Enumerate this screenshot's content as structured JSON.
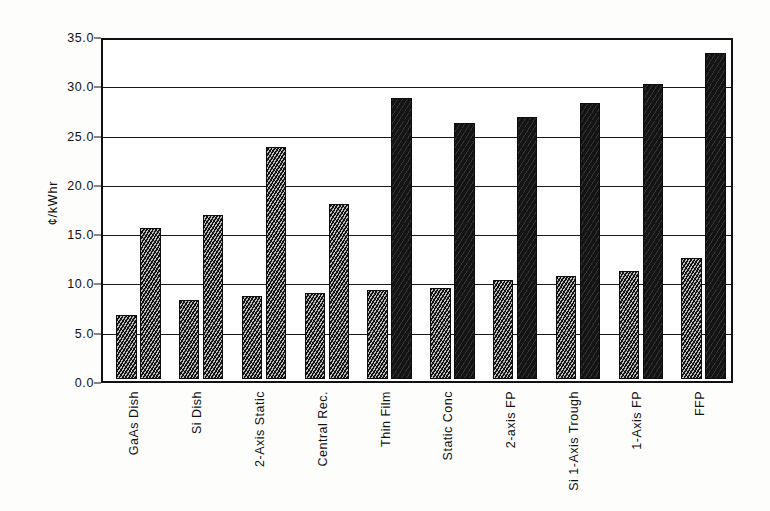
{
  "chart_data": {
    "type": "bar",
    "title": "",
    "subtitle": "",
    "xlabel": "",
    "ylabel": "¢/kWhr",
    "ylim": [
      0.0,
      35.0
    ],
    "yticks": [
      "0.0",
      "5.0",
      "10.0",
      "15.0",
      "20.0",
      "25.0",
      "30.0",
      "35.0"
    ],
    "ytick_values": [
      0.0,
      5.0,
      10.0,
      15.0,
      20.0,
      25.0,
      30.0,
      35.0
    ],
    "grid": "horizontal",
    "legend": "none",
    "categories": [
      "GaAs Dish",
      "Si Dish",
      "2-Axis Static",
      "Central Rec.",
      "Thin Film",
      "Static Conc",
      "2-axis FP",
      "Si 1-Axis Trough",
      "1-Axis FP",
      "FFP"
    ],
    "series": [
      {
        "name": "series-1",
        "values": [
          6.5,
          8.0,
          8.4,
          8.7,
          9.0,
          9.2,
          10.0,
          10.5,
          11.0,
          12.3
        ]
      },
      {
        "name": "series-2",
        "values": [
          15.3,
          16.6,
          23.5,
          17.8,
          28.5,
          26.0,
          26.6,
          28.0,
          29.9,
          33.1
        ]
      }
    ],
    "colors": {
      "series_1_fill": "#141414",
      "series_2_fill": "#141414",
      "axis": "#111111",
      "grid": "#1a1a1a",
      "background": "#ffffff"
    }
  }
}
